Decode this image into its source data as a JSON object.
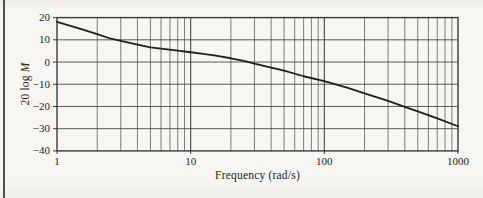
{
  "figure": {
    "ylabel_prefix": "20 log ",
    "ylabel_var": "M",
    "xlabel": "Frequency (rad/s)"
  },
  "chart_data": {
    "type": "line",
    "title": "",
    "xlabel": "Frequency (rad/s)",
    "ylabel": "20 log M",
    "x_scale": "log",
    "xlim": [
      1,
      1000
    ],
    "ylim": [
      -40,
      20
    ],
    "x_ticks": [
      1,
      10,
      100,
      1000
    ],
    "y_ticks": [
      20,
      10,
      0,
      -10,
      -20,
      -30,
      -40
    ],
    "grid": "full grid: horizontal every 10 dB, vertical log minors 2-9 each decade",
    "legend": "none",
    "series": [
      {
        "name": "magnitude response (dB)",
        "x": [
          1,
          1.5,
          2,
          2.5,
          3,
          4,
          5,
          6,
          8,
          10,
          12,
          15,
          20,
          25,
          30,
          40,
          50,
          70,
          100,
          150,
          200,
          300,
          400,
          500,
          700,
          1000
        ],
        "y": [
          18.1,
          14.9,
          12.6,
          10.6,
          9.5,
          7.8,
          6.6,
          6.0,
          5.1,
          4.4,
          3.8,
          3.0,
          1.7,
          0.5,
          -0.7,
          -2.5,
          -3.9,
          -6.4,
          -8.6,
          -11.6,
          -14.1,
          -17.5,
          -20.2,
          -22.2,
          -25.4,
          -28.9
        ]
      }
    ]
  },
  "style": {
    "paper_color": "#f7f6f2",
    "minor_grid_color": "#5c5c5c",
    "major_grid_color": "#474747",
    "box_color": "#3a3a3a",
    "curve_color": "#1f1f1f",
    "text_color": "#1c1c1c",
    "page_rule_color": "#4f4f4f"
  }
}
